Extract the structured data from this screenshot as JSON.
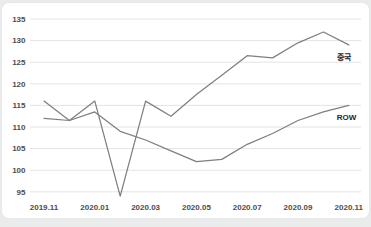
{
  "chart_data": {
    "type": "line",
    "title": "",
    "xlabel": "",
    "ylabel": "",
    "categories": [
      "2019.11",
      "2019.12",
      "2020.01",
      "2020.02",
      "2020.03",
      "2020.04",
      "2020.05",
      "2020.06",
      "2020.07",
      "2020.08",
      "2020.09",
      "2020.10",
      "2020.11"
    ],
    "x_tick_labels": [
      "2019.11",
      "2020.01",
      "2020.03",
      "2020.05",
      "2020.07",
      "2020.09",
      "2020.11"
    ],
    "series": [
      {
        "name": "중국",
        "values": [
          116,
          111.5,
          116,
          94,
          116,
          112.5,
          117.5,
          122,
          126.5,
          126,
          129.5,
          132,
          129
        ]
      },
      {
        "name": "ROW",
        "values": [
          112,
          111.5,
          113.5,
          109,
          107,
          104.5,
          102,
          102.5,
          106,
          108.5,
          111.5,
          113.5,
          115
        ]
      }
    ],
    "ylim": [
      95,
      135
    ],
    "ytick_step": 5,
    "y_tick_labels": [
      "95",
      "100",
      "105",
      "110",
      "115",
      "120",
      "125",
      "130",
      "135"
    ],
    "grid": true,
    "legend_position": "line-end-labels"
  },
  "colors": {
    "line": "#7f7f7f",
    "grid": "#e4e4e4",
    "tick_label": "#4d4d4d",
    "series_label": "#262626",
    "card_bg": "#ffffff",
    "card_border": "#e7e9e9",
    "page_bg": "#eaecec"
  }
}
